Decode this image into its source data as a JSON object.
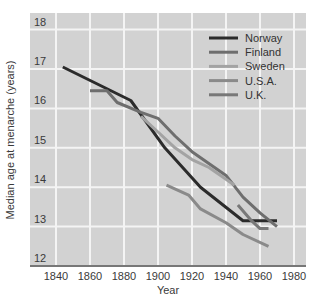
{
  "chart_data": {
    "type": "line",
    "title": "",
    "xlabel": "Year",
    "ylabel": "Median age at menarche (years)",
    "xlim": [
      1830,
      1987
    ],
    "ylim": [
      12,
      18.4
    ],
    "x_ticks": [
      1840,
      1860,
      1880,
      1900,
      1920,
      1940,
      1960,
      1980
    ],
    "y_ticks": [
      12,
      13,
      14,
      15,
      16,
      17,
      18
    ],
    "grid": true,
    "legend_position": "upper right",
    "series": [
      {
        "name": "Norway",
        "color": "#2b2b2b",
        "width": 3,
        "x": [
          1844,
          1884,
          1904,
          1925,
          1950,
          1970
        ],
        "y": [
          17.05,
          16.2,
          15.0,
          14.0,
          13.15,
          13.15
        ]
      },
      {
        "name": "Finland",
        "color": "#6e6e6e",
        "width": 3,
        "x": [
          1860,
          1870,
          1876,
          1890,
          1900,
          1910,
          1920,
          1940,
          1950,
          1960,
          1970
        ],
        "y": [
          16.45,
          16.45,
          16.15,
          15.9,
          15.75,
          15.3,
          14.9,
          14.3,
          13.75,
          13.35,
          13.0
        ]
      },
      {
        "name": "Sweden",
        "color": "#a3a3a3",
        "width": 3,
        "x": [
          1890,
          1900,
          1910,
          1920,
          1930,
          1940,
          1945
        ],
        "y": [
          15.8,
          15.4,
          15.0,
          14.7,
          14.5,
          14.2,
          14.05
        ]
      },
      {
        "name": "U.S.A.",
        "color": "#8a8a8a",
        "width": 3,
        "x": [
          1905,
          1918,
          1925,
          1940,
          1950,
          1965
        ],
        "y": [
          14.05,
          13.8,
          13.45,
          13.1,
          12.8,
          12.5
        ]
      },
      {
        "name": "U.K.",
        "color": "#787878",
        "width": 3,
        "x": [
          1947,
          1955,
          1960,
          1965
        ],
        "y": [
          13.55,
          13.15,
          12.95,
          12.95
        ]
      }
    ]
  },
  "legend": {
    "items": [
      {
        "label": "Norway",
        "color": "#2b2b2b"
      },
      {
        "label": "Finland",
        "color": "#6e6e6e"
      },
      {
        "label": "Sweden",
        "color": "#a3a3a3"
      },
      {
        "label": "U.S.A.",
        "color": "#8a8a8a"
      },
      {
        "label": "U.K.",
        "color": "#787878"
      }
    ]
  },
  "colors": {
    "plot_background": "#d2d2d2",
    "gridline": "#f4f4f4",
    "axis_line": "#777777"
  }
}
